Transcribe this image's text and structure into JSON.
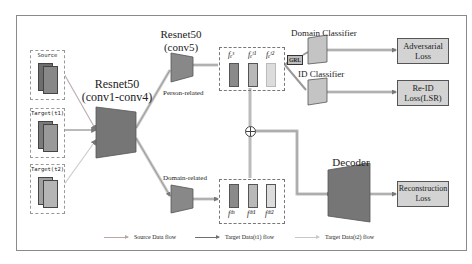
{
  "inputs": [
    {
      "label": "Source",
      "id": "source"
    },
    {
      "label": "Target(t1)",
      "id": "target-t1"
    },
    {
      "label": "Target(t2)",
      "id": "target-t2"
    }
  ],
  "backbone": {
    "name": "Resnet50",
    "sub": "(conv1-conv4)"
  },
  "conv5": {
    "name": "Resnet50",
    "sub": "(conv5)"
  },
  "branches": {
    "person": "Person-related",
    "domain": "Domain-related"
  },
  "person_features": {
    "labels": [
      "f_e^s",
      "f_e^t1",
      "f_e^t2"
    ],
    "display": [
      "fₑˢ",
      "fₑᵗ¹",
      "fₑᵗ²"
    ]
  },
  "domain_features": {
    "labels": [
      "f_d^s",
      "f_d^t1",
      "f_d^t2"
    ],
    "display": [
      "fᵈˢ",
      "fᵈᵗ¹",
      "fᵈᵗ²"
    ]
  },
  "grl": "GRL",
  "classifiers": {
    "domain": "Domain Classifier",
    "id": "ID Classifier"
  },
  "decoder": "Decoder",
  "losses": {
    "adversarial": "Adversarial Loss",
    "reid_line1": "Re-ID",
    "reid_line2": "Loss(LSR)",
    "adv_line1": "Adversarial",
    "adv_line2": "Loss",
    "recon_line1": "Reconstruction",
    "recon_line2": "Loss"
  },
  "legend": [
    {
      "label": "Source Data flow",
      "color": "#b8a8a8"
    },
    {
      "label": "Target Data(t1) flow",
      "color": "#707070"
    },
    {
      "label": "Target Data(t2) flow",
      "color": "#c8c8c8"
    }
  ],
  "colors": {
    "module_fill": "#767676",
    "box_fill": "#d3d3d3",
    "bar_dark": "#8a8a8a",
    "bar_mid": "#b8b8b8",
    "bar_light": "#dcdcdc"
  }
}
